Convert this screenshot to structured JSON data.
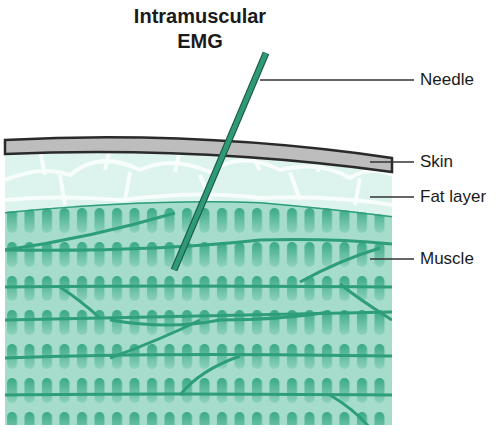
{
  "title": {
    "line1": "Intramuscular",
    "line2": "EMG"
  },
  "labels": {
    "needle": "Needle",
    "skin": "Skin",
    "fat": "Fat layer",
    "muscle": "Muscle"
  },
  "colors": {
    "needle": "#2e9a78",
    "needle_outline": "#1c5a46",
    "skin": "#bdbdbd",
    "skin_border": "#2a2a2a",
    "fat": "#dcf3ee",
    "fat_cells": "#f4fcfa",
    "muscle_bg": "#a6dccb",
    "muscle_line": "#2e9e7a",
    "striation": "#4fb593",
    "leader": "#333333"
  }
}
